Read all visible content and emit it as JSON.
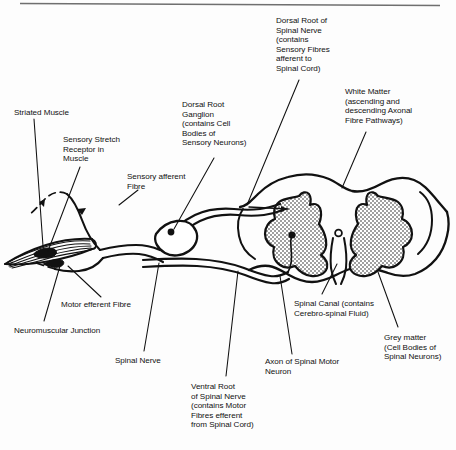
{
  "figure": {
    "ink_color": "#111111",
    "background_color": "#fdfdfd",
    "rule_color": "#6f6f6f"
  },
  "labels": [
    {
      "name": "dorsal-root-of-spinal-nerve",
      "text": "Dorsal Root of\nSpinal Nerve\n(contains\nSensory Fibres\nafferent to\nSpinal Cord)",
      "x": 276,
      "y": 16
    },
    {
      "name": "white-matter",
      "text": "White Matter\n(ascending and\ndescending Axonal\nFibre Pathways)",
      "x": 345,
      "y": 87
    },
    {
      "name": "striated-muscle",
      "text": "Striated Muscle",
      "x": 14,
      "y": 108
    },
    {
      "name": "dorsal-root-ganglion",
      "text": "Dorsal Root\nGanglion\n(contains Cell\nBodies of\nSensory Neurons)",
      "x": 182,
      "y": 100
    },
    {
      "name": "sensory-stretch-receptor",
      "text": "Sensory Stretch\nReceptor in\nMuscle",
      "x": 63,
      "y": 135
    },
    {
      "name": "sensory-afferent-fibre",
      "text": "Sensory afferent\nFibre",
      "x": 127,
      "y": 172
    },
    {
      "name": "motor-efferent-fibre",
      "text": "Motor efferent Fibre",
      "x": 61,
      "y": 300
    },
    {
      "name": "spinal-canal",
      "text": "Spinal Canal (contains\nCerebro-spinal Fluid)",
      "x": 294,
      "y": 299
    },
    {
      "name": "neuromuscular-junction",
      "text": "Neuromuscular Junction",
      "x": 14,
      "y": 326
    },
    {
      "name": "grey-matter",
      "text": "Grey matter\n(Cell Bodies of\nSpinal Neurons)",
      "x": 384,
      "y": 333
    },
    {
      "name": "spinal-nerve",
      "text": "Spinal Nerve",
      "x": 115,
      "y": 356
    },
    {
      "name": "axon-of-spinal-motor-neuron",
      "text": "Axon of Spinal Motor\nNeuron",
      "x": 265,
      "y": 357
    },
    {
      "name": "ventral-root-of-spinal-nerve",
      "text": "Ventral Root\nof Spinal Nerve\n(contains Motor\nFibres efferent\nfrom Spinal Cord)",
      "x": 191,
      "y": 382
    }
  ]
}
